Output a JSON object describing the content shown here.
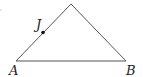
{
  "diagram": {
    "type": "triangle",
    "vertices": {
      "A": {
        "label": "A",
        "x": 16,
        "y": 61
      },
      "B": {
        "label": "B",
        "x": 126,
        "y": 61
      },
      "apex": {
        "label": "",
        "x": 71,
        "y": 4
      }
    },
    "points": [
      {
        "label": "J",
        "on_segment": "A-apex",
        "x": 43,
        "y": 32
      }
    ],
    "colors": {
      "line": "#555555",
      "point": "#111111",
      "text": "#222222"
    }
  }
}
